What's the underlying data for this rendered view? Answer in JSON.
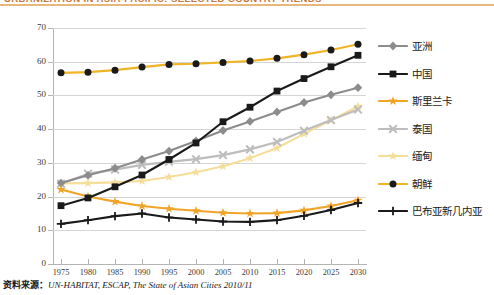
{
  "figure": {
    "title_truncated": "URBANIZATION IN ASIA-PACIFIC: SELECTED COUNTRY TRENDS",
    "source_label": "资料来源：",
    "source_text": "UN-HABITAT, ESCAP, The State of Asian Cities 2010/11"
  },
  "chart_data": {
    "type": "line",
    "title": "URBANIZATION IN ASIA-PACIFIC: SELECTED COUNTRY TRENDS",
    "xlabel": "",
    "ylabel": "",
    "x": [
      1975,
      1980,
      1985,
      1990,
      1995,
      2000,
      2005,
      2010,
      2015,
      2020,
      2025,
      2030
    ],
    "categories": [
      "1975",
      "1980",
      "1985",
      "1990",
      "1995",
      "2000",
      "2005",
      "2010",
      "2015",
      "2020",
      "2025",
      "2030"
    ],
    "ylim": [
      0,
      70
    ],
    "yticks": [
      0,
      10,
      20,
      30,
      40,
      50,
      60,
      70
    ],
    "grid": true,
    "legend_position": "right",
    "series": [
      {
        "name": "亚洲",
        "color": "#8c8c8c",
        "marker": "diamond",
        "values": [
          24.0,
          26.3,
          28.4,
          31.0,
          33.5,
          36.5,
          39.6,
          42.3,
          45.1,
          47.9,
          50.2,
          52.3
        ]
      },
      {
        "name": "中国",
        "color": "#1a1a1a",
        "marker": "square",
        "values": [
          17.3,
          19.6,
          22.9,
          26.4,
          31.0,
          35.9,
          42.2,
          46.5,
          51.3,
          55.0,
          58.5,
          61.9
        ]
      },
      {
        "name": "斯里兰卡",
        "color": "#f0a428",
        "marker": "star",
        "values": [
          22.1,
          20.0,
          18.5,
          17.2,
          16.4,
          15.8,
          15.2,
          15.0,
          15.1,
          15.9,
          17.2,
          18.9
        ]
      },
      {
        "name": "泰国",
        "color": "#bdbdbd",
        "marker": "x",
        "values": [
          23.8,
          26.8,
          28.0,
          29.4,
          30.3,
          31.1,
          32.3,
          34.0,
          36.2,
          39.5,
          42.7,
          45.8
        ]
      },
      {
        "name": "缅甸",
        "color": "#f5dd9a",
        "marker": "star",
        "values": [
          23.9,
          24.0,
          24.2,
          24.6,
          25.8,
          27.2,
          29.0,
          31.4,
          34.4,
          38.6,
          42.6,
          46.8
        ]
      },
      {
        "name": "朝鲜",
        "color": "#f0b429",
        "marker": "circle",
        "values": [
          56.7,
          56.9,
          57.5,
          58.4,
          59.2,
          59.4,
          59.8,
          60.2,
          61.0,
          62.1,
          63.5,
          65.2
        ]
      },
      {
        "name": "巴布亚新几内亚",
        "color": "#1a1a1a",
        "marker": "plus",
        "values": [
          11.9,
          13.0,
          14.2,
          15.0,
          13.8,
          13.2,
          12.6,
          12.5,
          13.0,
          14.3,
          16.0,
          18.1
        ]
      }
    ]
  },
  "legend": {
    "items": [
      {
        "label": "亚洲"
      },
      {
        "label": "中国"
      },
      {
        "label": "斯里兰卡"
      },
      {
        "label": "泰国"
      },
      {
        "label": "缅甸"
      },
      {
        "label": "朝鲜"
      },
      {
        "label": "巴布亚新几内亚"
      }
    ]
  },
  "axes": {
    "y_tick_labels": [
      "70",
      "60",
      "50",
      "40",
      "30",
      "20",
      "10",
      "0"
    ],
    "x_tick_labels": [
      "1975",
      "1980",
      "1985",
      "1990",
      "1995",
      "2000",
      "2005",
      "2010",
      "2015",
      "2020",
      "2025",
      "2030"
    ]
  }
}
